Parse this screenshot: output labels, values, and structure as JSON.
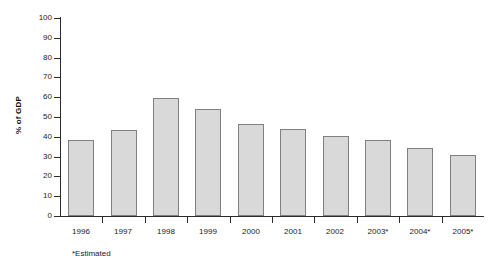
{
  "chart_data": {
    "type": "bar",
    "title": "",
    "subtitle": "",
    "xlabel": "",
    "ylabel": "% of GDP",
    "categories": [
      "1996",
      "1997",
      "1998",
      "1999",
      "2000",
      "2001",
      "2002",
      "2003*",
      "2004*",
      "2005*"
    ],
    "values": [
      38.5,
      43.5,
      59.5,
      54,
      46.5,
      44,
      40.5,
      38.5,
      34.5,
      31
    ],
    "series": [
      {
        "name": "% of GDP",
        "values": [
          38.5,
          43.5,
          59.5,
          54,
          46.5,
          44,
          40.5,
          38.5,
          34.5,
          31
        ]
      }
    ],
    "ylim": [
      0,
      100
    ],
    "ytick_labels": [
      "0",
      "10",
      "20",
      "30",
      "40",
      "50",
      "60",
      "70",
      "80",
      "90",
      "100"
    ],
    "ytick_values": [
      0,
      10,
      20,
      30,
      40,
      50,
      60,
      70,
      80,
      90,
      100
    ],
    "grid": false,
    "legend": false,
    "legend_position": "none",
    "annotations": [
      "*Estimated"
    ],
    "bar_fill_color": "#d9d9d9",
    "bar_border_color": "#808080",
    "axis_color": "#2b2b2b"
  },
  "footnote": "*Estimated"
}
